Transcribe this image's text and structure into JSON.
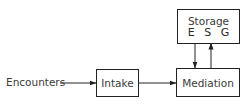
{
  "diagram": {
    "type": "flow-diagram",
    "nodes": [
      {
        "id": "encounters",
        "label": "Encounters",
        "boxed": false
      },
      {
        "id": "intake",
        "label": "Intake",
        "boxed": true
      },
      {
        "id": "mediation",
        "label": "Mediation",
        "boxed": true
      },
      {
        "id": "storage",
        "label": "Storage",
        "sublabel": "E S G",
        "boxed": true
      }
    ],
    "edges": [
      {
        "from": "encounters",
        "to": "intake"
      },
      {
        "from": "intake",
        "to": "mediation"
      },
      {
        "from": "storage",
        "to": "mediation"
      },
      {
        "from": "mediation",
        "to": "storage"
      }
    ]
  }
}
